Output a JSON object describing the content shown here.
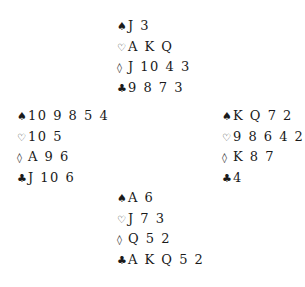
{
  "deal": {
    "north": {
      "spades": "J 3",
      "hearts": "A K Q",
      "diamonds": "J 10 4 3",
      "clubs": "9 8 7 3"
    },
    "west": {
      "spades": "10 9 8 5 4",
      "hearts": "10 5",
      "diamonds": "A 9 6",
      "clubs": "J 10 6"
    },
    "east": {
      "spades": "K Q 7 2",
      "hearts": "9 8 6 4 2",
      "diamonds": "K 8 7",
      "clubs": "4"
    },
    "south": {
      "spades": "A 6",
      "hearts": "J 7 3",
      "diamonds": "Q 5 2",
      "clubs": "A K Q 5 2"
    }
  },
  "suit_symbols": {
    "spades": "♠",
    "hearts": "♡",
    "diamonds": "◊",
    "clubs": "♣"
  }
}
